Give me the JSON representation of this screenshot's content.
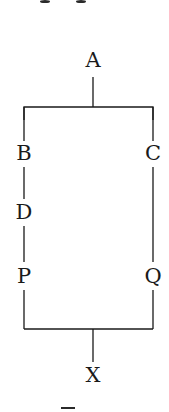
{
  "diagram": {
    "type": "tree",
    "line_color": "#1a1a1a",
    "nodes": {
      "A": {
        "label": "A",
        "x": 93,
        "y": 60
      },
      "B": {
        "label": "B",
        "x": 24,
        "y": 153
      },
      "C": {
        "label": "C",
        "x": 153,
        "y": 153
      },
      "D": {
        "label": "D",
        "x": 24,
        "y": 212
      },
      "P": {
        "label": "P",
        "x": 24,
        "y": 276
      },
      "Q": {
        "label": "Q",
        "x": 153,
        "y": 276
      },
      "X": {
        "label": "X",
        "x": 93,
        "y": 375
      }
    },
    "edges": [
      [
        "A",
        "B"
      ],
      [
        "A",
        "C"
      ],
      [
        "B",
        "D"
      ],
      [
        "D",
        "P"
      ],
      [
        "C",
        "Q"
      ],
      [
        "P",
        "X"
      ],
      [
        "Q",
        "X"
      ]
    ]
  }
}
